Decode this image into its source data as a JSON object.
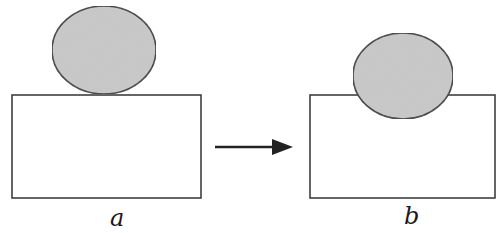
{
  "figure": {
    "colors": {
      "stroke": "#333333",
      "droplet_fill": "#c9c9c9",
      "background": "#ffffff",
      "arrow": "#222222"
    },
    "panels": [
      {
        "label": "a",
        "droplet": {
          "cx": 104,
          "cy": 50,
          "rx": 52,
          "ry": 44
        },
        "substrate": {
          "x": 12,
          "y": 95,
          "width": 189,
          "height": 103
        }
      },
      {
        "label": "b",
        "droplet": {
          "cx": 403,
          "cy": 76,
          "rx": 50,
          "ry": 43
        },
        "substrate": {
          "x": 310,
          "y": 95,
          "width": 185,
          "height": 103
        }
      }
    ],
    "arrow": {
      "x1": 215,
      "y1": 147,
      "x2": 292,
      "y2": 147,
      "direction": "right-arrow"
    }
  }
}
